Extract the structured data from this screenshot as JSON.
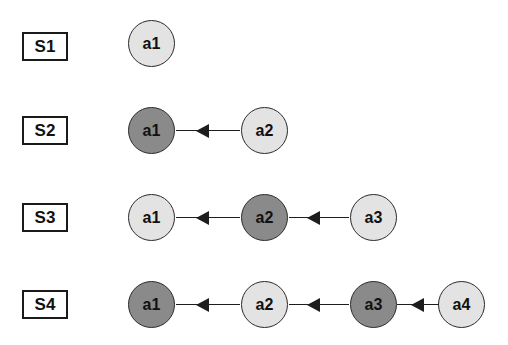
{
  "diagram": {
    "background_color": "#ffffff",
    "node_light_color": "#e3e3e3",
    "node_dark_color": "#8a8a8a",
    "node_border_color": "#2b2b2b",
    "edge_color": "#1d1d1d",
    "label_border_color": "#1a1a1a",
    "edge_direction": "right-to-left",
    "rows": [
      {
        "label": "S1",
        "nodes": [
          {
            "label": "a1",
            "shade": "light"
          }
        ],
        "edges": []
      },
      {
        "label": "S2",
        "nodes": [
          {
            "label": "a1",
            "shade": "dark"
          },
          {
            "label": "a2",
            "shade": "light"
          }
        ],
        "edges": [
          {
            "from": "a2",
            "to": "a1"
          }
        ]
      },
      {
        "label": "S3",
        "nodes": [
          {
            "label": "a1",
            "shade": "light"
          },
          {
            "label": "a2",
            "shade": "dark"
          },
          {
            "label": "a3",
            "shade": "light"
          }
        ],
        "edges": [
          {
            "from": "a2",
            "to": "a1"
          },
          {
            "from": "a3",
            "to": "a2"
          }
        ]
      },
      {
        "label": "S4",
        "nodes": [
          {
            "label": "a1",
            "shade": "dark"
          },
          {
            "label": "a2",
            "shade": "light"
          },
          {
            "label": "a3",
            "shade": "dark"
          },
          {
            "label": "a4",
            "shade": "light"
          }
        ],
        "edges": [
          {
            "from": "a2",
            "to": "a1"
          },
          {
            "from": "a3",
            "to": "a2"
          },
          {
            "from": "a4",
            "to": "a3"
          }
        ]
      }
    ]
  }
}
